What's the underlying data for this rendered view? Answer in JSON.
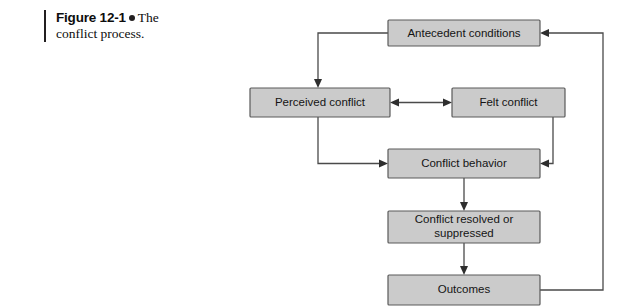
{
  "caption": {
    "figure_number": "Figure 12-1",
    "bullet": "round-bullet",
    "text_part_1": "The",
    "text_part_2": "conflict process."
  },
  "colors": {
    "box_fill": "#cbcbcb",
    "box_border": "#5a5a5a",
    "connector": "#4a4a4a",
    "text": "#141414",
    "rule": "#231f20"
  },
  "diagram": {
    "type": "flowchart",
    "title": "The conflict process",
    "nodes": [
      {
        "id": "antecedent",
        "label": "Antecedent conditions",
        "x": 388,
        "y": 20,
        "w": 152,
        "h": 26
      },
      {
        "id": "perceived",
        "label": "Perceived conflict",
        "x": 250,
        "y": 88,
        "w": 140,
        "h": 29
      },
      {
        "id": "felt",
        "label": "Felt conflict",
        "x": 452,
        "y": 88,
        "w": 113,
        "h": 29
      },
      {
        "id": "behavior",
        "label": "Conflict behavior",
        "x": 388,
        "y": 149,
        "w": 152,
        "h": 29
      },
      {
        "id": "resolved",
        "label_line_1": "Conflict resolved or",
        "label_line_2": "suppressed",
        "x": 388,
        "y": 211,
        "w": 152,
        "h": 32
      },
      {
        "id": "outcomes",
        "label": "Outcomes",
        "x": 388,
        "y": 275,
        "w": 152,
        "h": 30
      }
    ],
    "edges": [
      {
        "from": "antecedent",
        "to": "perceived",
        "style": "elbow-left-down",
        "arrow": "single"
      },
      {
        "from": "perceived",
        "to": "felt",
        "style": "straight",
        "arrow": "double"
      },
      {
        "from": "perceived",
        "to": "behavior",
        "style": "elbow-down-right",
        "arrow": "single"
      },
      {
        "from": "felt",
        "to": "behavior",
        "style": "elbow-down-left",
        "arrow": "single"
      },
      {
        "from": "behavior",
        "to": "resolved",
        "style": "straight-down",
        "arrow": "single"
      },
      {
        "from": "resolved",
        "to": "outcomes",
        "style": "straight-down",
        "arrow": "single"
      },
      {
        "from": "outcomes",
        "to": "antecedent",
        "style": "feedback-loop-right-up",
        "arrow": "single"
      }
    ]
  }
}
